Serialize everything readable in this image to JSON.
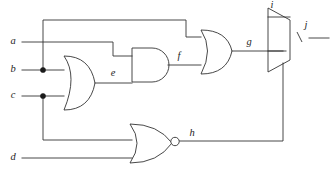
{
  "diagram": {
    "type": "digital-logic-circuit",
    "stroke_color": "#333333",
    "background_color": "#ffffff",
    "junction_color": "#1a1a1a"
  },
  "labels": {
    "a": "a",
    "b": "b",
    "c": "c",
    "d": "d",
    "e": "e",
    "f": "f",
    "g": "g",
    "h": "h",
    "i": "i",
    "j": "j"
  },
  "inputs": [
    {
      "name": "a",
      "label": "a",
      "y": 42
    },
    {
      "name": "b",
      "label": "b",
      "y": 70
    },
    {
      "name": "c",
      "label": "c",
      "y": 96
    },
    {
      "name": "d",
      "label": "d",
      "y": 158
    }
  ],
  "nets": [
    {
      "name": "e",
      "label": "e",
      "source": "or-gate-bc",
      "targets": [
        "and-gate-ae"
      ]
    },
    {
      "name": "f",
      "label": "f",
      "source": "and-gate-ae",
      "targets": [
        "or-gate-fb"
      ]
    },
    {
      "name": "g",
      "label": "g",
      "source": "or-gate-fb",
      "targets": [
        "mux"
      ]
    },
    {
      "name": "h",
      "label": "h",
      "source": "nor-gate-cd",
      "targets": [
        "mux"
      ]
    },
    {
      "name": "i",
      "label": "i",
      "source": "external",
      "targets": [
        "mux"
      ]
    },
    {
      "name": "j",
      "label": "j",
      "source": "mux",
      "targets": [
        "external"
      ]
    }
  ],
  "gates": [
    {
      "name": "or-gate-bc",
      "kind": "OR",
      "inputs": [
        "b",
        "c"
      ],
      "output": "e"
    },
    {
      "name": "and-gate-ae",
      "kind": "AND",
      "inputs": [
        "a",
        "e"
      ],
      "output": "f"
    },
    {
      "name": "or-gate-fb",
      "kind": "OR",
      "inputs": [
        "f",
        "b"
      ],
      "output": "g"
    },
    {
      "name": "nor-gate-cd",
      "kind": "NOR",
      "inputs": [
        "c",
        "d"
      ],
      "output": "h"
    },
    {
      "name": "mux",
      "kind": "MUX",
      "inputs": [
        "i",
        "g",
        "h"
      ],
      "output": "j"
    }
  ],
  "junctions": [
    {
      "name": "junction-b",
      "x": 43,
      "y": 70
    },
    {
      "name": "junction-c",
      "x": 43,
      "y": 96
    }
  ]
}
